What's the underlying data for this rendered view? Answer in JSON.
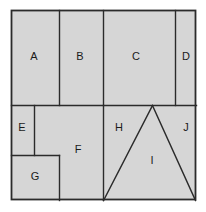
{
  "figure": {
    "canvas": {
      "width": 206,
      "height": 212
    },
    "colors": {
      "background": "#ffffff",
      "fill": "#d6d6d6",
      "stroke": "#2b2b2b",
      "label": "#1a1a1a"
    },
    "outer_border": {
      "x": 11,
      "y": 10,
      "width": 185,
      "height": 190
    },
    "regions": [
      {
        "id": "A",
        "label": "A",
        "shape": "rectangle",
        "x": 11,
        "y": 10,
        "width": 48,
        "height": 95,
        "label_x": 34,
        "label_y": 57
      },
      {
        "id": "B",
        "label": "B",
        "shape": "rectangle",
        "x": 59,
        "y": 10,
        "width": 44,
        "height": 95,
        "label_x": 80,
        "label_y": 57
      },
      {
        "id": "C",
        "label": "C",
        "shape": "rectangle",
        "x": 103,
        "y": 10,
        "width": 72,
        "height": 95,
        "label_x": 136,
        "label_y": 57
      },
      {
        "id": "D",
        "label": "D",
        "shape": "rectangle",
        "x": 175,
        "y": 10,
        "width": 21,
        "height": 95,
        "label_x": 186,
        "label_y": 57
      },
      {
        "id": "E",
        "label": "E",
        "shape": "rectangle",
        "x": 11,
        "y": 105,
        "width": 23,
        "height": 50,
        "label_x": 22,
        "label_y": 128
      },
      {
        "id": "F",
        "label": "F",
        "shape": "polygon",
        "points": "34,105 103,105 103,200 59,200 59,155 34,155",
        "label_x": 78,
        "label_y": 150
      },
      {
        "id": "G",
        "label": "G",
        "shape": "rectangle",
        "x": 11,
        "y": 155,
        "width": 48,
        "height": 45,
        "label_x": 35,
        "label_y": 177
      },
      {
        "id": "H",
        "label": "H",
        "shape": "polygon",
        "points": "103,105 152,105 103,200",
        "label_x": 119,
        "label_y": 128
      },
      {
        "id": "I",
        "label": "I",
        "shape": "polygon",
        "points": "152,105 195,200 103,200",
        "label_x": 152,
        "label_y": 161
      },
      {
        "id": "J",
        "label": "J",
        "shape": "polygon",
        "points": "152,105 196,105 196,200 195,200",
        "label_x": 186,
        "label_y": 128
      }
    ],
    "dividers": [
      {
        "name": "vertical-a-b",
        "x1": 59,
        "y1": 10,
        "x2": 59,
        "y2": 105
      },
      {
        "name": "vertical-b-c",
        "x1": 103,
        "y1": 10,
        "x2": 103,
        "y2": 105
      },
      {
        "name": "vertical-c-d",
        "x1": 175,
        "y1": 10,
        "x2": 175,
        "y2": 105
      },
      {
        "name": "horizontal-mid",
        "x1": 11,
        "y1": 105,
        "x2": 196,
        "y2": 105
      },
      {
        "name": "vertical-e-f",
        "x1": 34,
        "y1": 105,
        "x2": 34,
        "y2": 155
      },
      {
        "name": "horizontal-e-g",
        "x1": 11,
        "y1": 155,
        "x2": 59,
        "y2": 155
      },
      {
        "name": "vertical-g-f",
        "x1": 59,
        "y1": 155,
        "x2": 59,
        "y2": 200
      },
      {
        "name": "vertical-f-h",
        "x1": 103,
        "y1": 105,
        "x2": 103,
        "y2": 200
      },
      {
        "name": "triangle-left-leg",
        "x1": 103,
        "y1": 200,
        "x2": 152,
        "y2": 105
      },
      {
        "name": "triangle-right-leg",
        "x1": 152,
        "y1": 105,
        "x2": 195,
        "y2": 200
      }
    ]
  }
}
